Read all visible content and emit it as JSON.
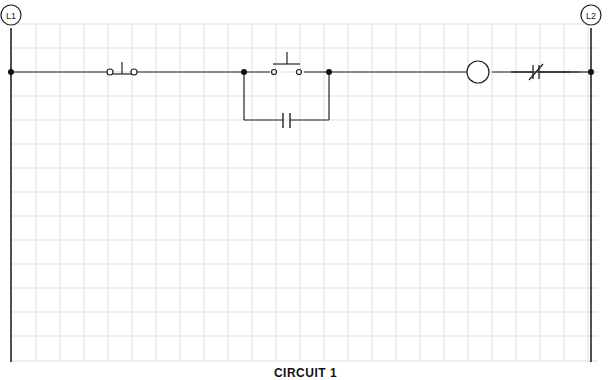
{
  "diagram": {
    "type": "ladder-logic",
    "rails": {
      "left_label": "L1",
      "right_label": "L2"
    },
    "rung": {
      "components": [
        {
          "kind": "pushbutton-nc",
          "name": "stop-pushbutton"
        },
        {
          "kind": "pushbutton-no",
          "name": "start-pushbutton"
        },
        {
          "kind": "contact-no",
          "name": "seal-in-contact",
          "branch": "parallel to start pushbutton"
        },
        {
          "kind": "coil",
          "name": "motor-starter-coil"
        },
        {
          "kind": "contact-nc",
          "name": "overload-contact"
        }
      ]
    },
    "caption": "CIRCUIT 1"
  },
  "colors": {
    "line": "#222222",
    "grid": "#dcdcdc",
    "background": "#ffffff"
  }
}
